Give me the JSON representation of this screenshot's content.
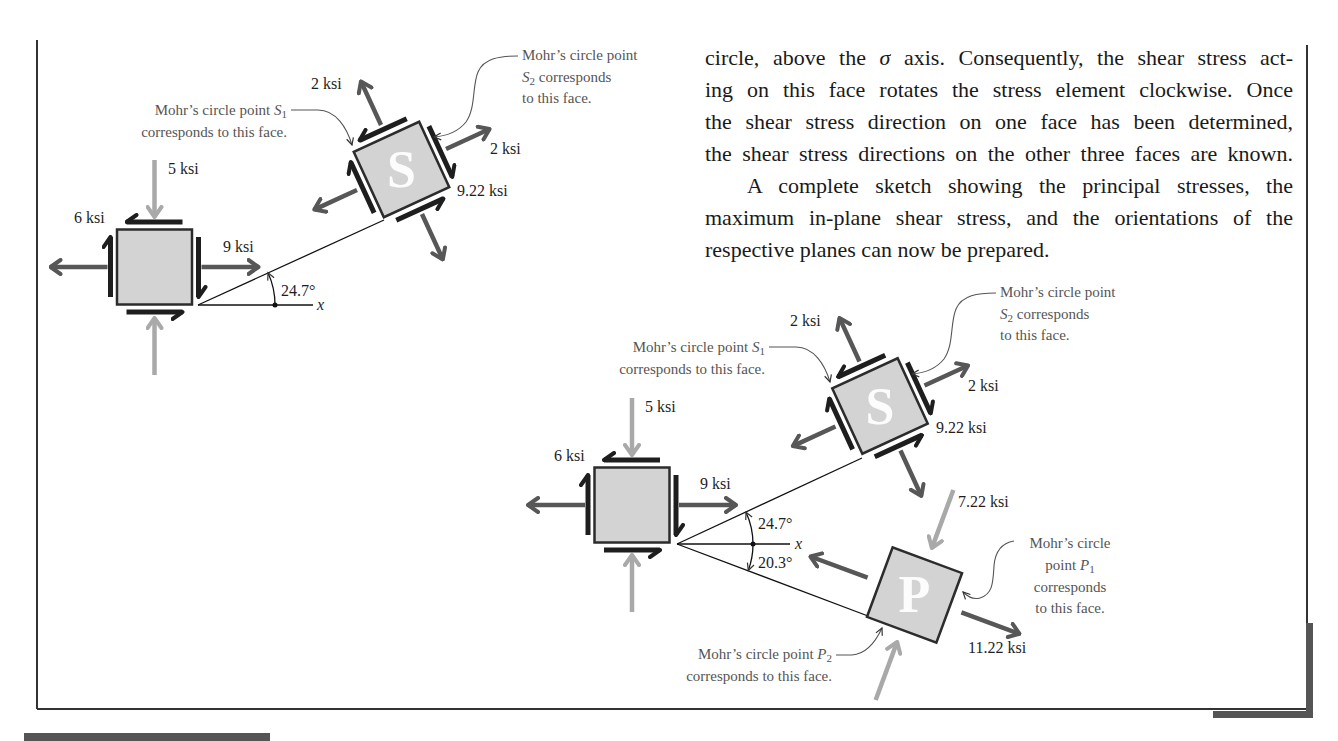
{
  "paragraph": {
    "line1_start": "circle, above the ",
    "line1_symbol": "σ",
    "line1_end": " axis. Consequently, the shear stress act-",
    "line2": "ing on this face rotates the stress element clockwise. Once",
    "line3": "the shear stress direction on one face has been determined,",
    "line4": "the shear stress directions on the other three faces are known.",
    "line5": "A complete sketch showing the principal stresses, the",
    "line6": "maximum in-plane shear stress, and the orientations of the",
    "line7": "respective planes can now be prepared."
  },
  "figure_top": {
    "original_element": {
      "sigma_y_label": "5 ksi",
      "tau_xy_label": "6 ksi",
      "sigma_x_label": "9 ksi"
    },
    "rotation_angle_label": "24.7°",
    "x_axis_label": "x",
    "max_shear_element": {
      "letter": "S",
      "normal_stress_upper_label": "2 ksi",
      "normal_stress_right_label": "2 ksi",
      "shear_stress_label": "9.22 ksi"
    },
    "callout_s1": {
      "line1": "Mohr’s circle point ",
      "symbol": "S",
      "subscript": "1",
      "line2": "corresponds to this face."
    },
    "callout_s2": {
      "line1": "Mohr’s circle point",
      "symbol": "S",
      "subscript": "2",
      "line2_rest": " corresponds",
      "line3": "to this face."
    }
  },
  "figure_bottom": {
    "original_element": {
      "sigma_y_label": "5 ksi",
      "tau_xy_label": "6 ksi",
      "sigma_x_label": "9 ksi"
    },
    "angle_s_label": "24.7°",
    "angle_p_label": "20.3°",
    "x_axis_label": "x",
    "max_shear_element": {
      "letter": "S",
      "normal_stress_upper_label": "2 ksi",
      "normal_stress_right_label": "2 ksi",
      "shear_stress_label": "9.22 ksi"
    },
    "principal_element": {
      "letter": "P",
      "sigma_min_label": "7.22 ksi",
      "sigma_max_label": "11.22 ksi"
    },
    "callout_s1": {
      "line1": "Mohr’s circle point ",
      "symbol": "S",
      "subscript": "1",
      "line2": "corresponds to this face."
    },
    "callout_s2": {
      "line1": "Mohr’s circle point",
      "symbol": "S",
      "subscript": "2",
      "line2_rest": " corresponds",
      "line3": "to this face."
    },
    "callout_p1": {
      "line1": "Mohr’s circle",
      "line2_prefix": "point ",
      "symbol": "P",
      "subscript": "1",
      "line3": "corresponds",
      "line4": "to this face."
    },
    "callout_p2": {
      "line1": "Mohr’s circle point ",
      "symbol": "P",
      "subscript": "2",
      "line2": "corresponds to this face."
    }
  },
  "colors": {
    "element_fill": "#d3d3d3",
    "tension_arrow": "#575757",
    "compression_arrow": "#a9a9a9",
    "shear_arrow": "#1e1e1e",
    "callout_text": "#555555"
  }
}
